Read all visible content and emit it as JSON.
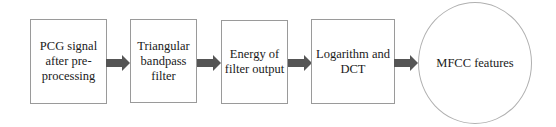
{
  "diagram": {
    "type": "flowchart",
    "direction": "left-to-right",
    "nodes": [
      {
        "id": "n1",
        "shape": "rect",
        "label": "PCG signal\nafter pre-\nprocessing"
      },
      {
        "id": "n2",
        "shape": "rect",
        "label": "Triangular\nbandpass\nfilter"
      },
      {
        "id": "n3",
        "shape": "rect",
        "label": "Energy of\nfilter output"
      },
      {
        "id": "n4",
        "shape": "rect",
        "label": "Logarithm and\nDCT"
      },
      {
        "id": "n5",
        "shape": "circle",
        "label": "MFCC features"
      }
    ],
    "edges": [
      {
        "from": "n1",
        "to": "n2"
      },
      {
        "from": "n2",
        "to": "n3"
      },
      {
        "from": "n3",
        "to": "n4"
      },
      {
        "from": "n4",
        "to": "n5"
      }
    ],
    "colors": {
      "arrow": "#555555",
      "border": "#9a9a9a"
    }
  }
}
